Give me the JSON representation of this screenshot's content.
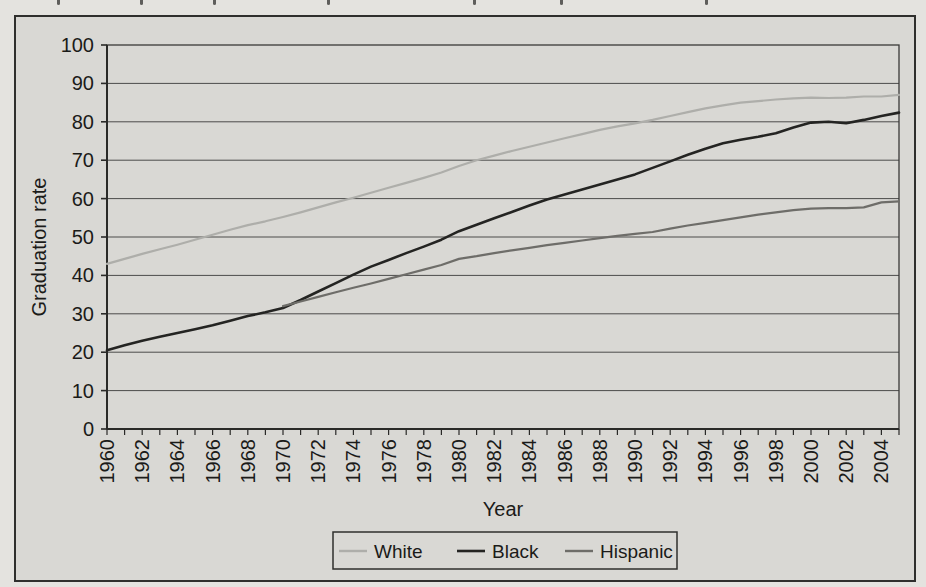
{
  "page": {
    "background_color": "#e4e3df",
    "figure_background_color": "#d9d8d4",
    "border_color": "#2f2f2d",
    "cropped_text_fragments": {
      "description": "illegible descender fragments of a text line cut off at the top edge",
      "x_positions": [
        57,
        140,
        213,
        327,
        473,
        560,
        705
      ]
    }
  },
  "chart_data": {
    "type": "line",
    "title": "",
    "xlabel": "Year",
    "ylabel": "Graduation rate",
    "x_range": [
      1960,
      2005
    ],
    "y_range": [
      0,
      100
    ],
    "y_ticks": [
      0,
      10,
      20,
      30,
      40,
      50,
      60,
      70,
      80,
      90,
      100
    ],
    "x_tick_labels": [
      "1960",
      "1962",
      "1964",
      "1966",
      "1968",
      "1970",
      "1972",
      "1974",
      "1976",
      "1978",
      "1980",
      "1982",
      "1984",
      "1986",
      "1988",
      "1990",
      "1992",
      "1994",
      "1996",
      "1998",
      "2000",
      "2002",
      "2004"
    ],
    "x_minor_tick_interval_years": 1,
    "grid": "horizontal",
    "gridline_color": "#4c4c4a",
    "axis_color": "#2a2a28",
    "legend_position": "bottom-center",
    "series": [
      {
        "name": "White",
        "color": "#aeaeaa",
        "x_start": 1960,
        "values": [
          43,
          44.3,
          45.6,
          46.8,
          48,
          49.3,
          50.6,
          51.9,
          53.1,
          54.1,
          55.2,
          56.4,
          57.7,
          59,
          60.2,
          61.5,
          62.8,
          64.1,
          65.4,
          66.8,
          68.5,
          70,
          71.2,
          72.4,
          73.5,
          74.6,
          75.7,
          76.8,
          77.9,
          78.8,
          79.6,
          80.5,
          81.5,
          82.5,
          83.5,
          84.3,
          85,
          85.4,
          85.8,
          86.1,
          86.3,
          86.2,
          86.3,
          86.6,
          86.6,
          87
        ]
      },
      {
        "name": "Black",
        "color": "#242422",
        "x_start": 1960,
        "values": [
          20.5,
          21.8,
          23,
          24,
          25,
          26,
          27,
          28.2,
          29.4,
          30.4,
          31.5,
          33.6,
          35.8,
          38,
          40.2,
          42.3,
          44,
          45.8,
          47.5,
          49.3,
          51.5,
          53.2,
          54.9,
          56.5,
          58.2,
          59.8,
          61.1,
          62.4,
          63.7,
          65,
          66.3,
          68,
          69.7,
          71.4,
          73,
          74.4,
          75.3,
          76.1,
          77,
          78.5,
          79.8,
          80,
          79.6,
          80.5,
          81.5,
          82.4
        ]
      },
      {
        "name": "Hispanic",
        "color": "#6e6d69",
        "x_start": 1970,
        "values": [
          32,
          33.2,
          34.4,
          35.6,
          36.8,
          37.9,
          39.1,
          40.3,
          41.5,
          42.7,
          44.3,
          45,
          45.8,
          46.5,
          47.2,
          47.9,
          48.5,
          49.1,
          49.7,
          50.3,
          50.8,
          51.3,
          52.2,
          53,
          53.7,
          54.4,
          55.1,
          55.8,
          56.4,
          57,
          57.4,
          57.5,
          57.5,
          57.7,
          59,
          59.3
        ]
      }
    ]
  }
}
